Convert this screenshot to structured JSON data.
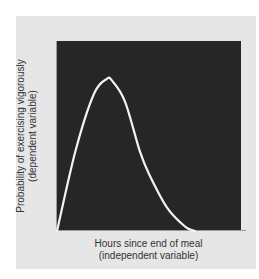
{
  "chart_data": {
    "type": "line",
    "title": "",
    "xlabel": "Hours since end of meal",
    "xlabel_sub": "(independent variable)",
    "ylabel": "Probability of exercising vigorously",
    "ylabel_sub": "(dependent variable)",
    "x_ticks": [],
    "y_ticks": [],
    "grid": false,
    "legend": null,
    "series": [
      {
        "name": "probability",
        "description": "Unimodal right-skewed curve: rises from zero, peaks early, then decays back to zero",
        "x": [
          0.0,
          0.1,
          0.2,
          0.27,
          0.3,
          0.37,
          0.45,
          0.5,
          0.6,
          0.7,
          0.75
        ],
        "values": [
          0.0,
          0.42,
          0.72,
          0.8,
          0.79,
          0.68,
          0.42,
          0.3,
          0.12,
          0.02,
          0.0
        ]
      }
    ],
    "xlim": [
      0,
      1
    ],
    "ylim": [
      0,
      1
    ],
    "colors": {
      "plot_background": "#262626",
      "curve": "#f2f2f2",
      "panel_background": "#e6e6e6"
    }
  }
}
